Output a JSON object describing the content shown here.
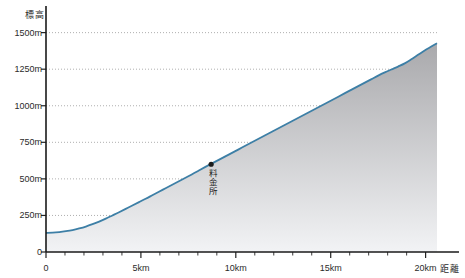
{
  "chart_data": {
    "type": "area",
    "title": "",
    "xlabel": "距離",
    "ylabel": "標高",
    "xlim": [
      0,
      20.6
    ],
    "ylim": [
      0,
      1600
    ],
    "grid": true,
    "legend": false,
    "x_unit": "km",
    "y_unit": "m",
    "x_ticks": [
      0,
      5,
      10,
      15,
      20
    ],
    "x_tick_labels": [
      "0",
      "5km",
      "10km",
      "15km",
      "20km"
    ],
    "x_minor_tick_step": 1,
    "y_ticks": [
      0,
      250,
      500,
      750,
      1000,
      1250,
      1500
    ],
    "y_tick_labels": [
      "0",
      "250m",
      "500m",
      "750m",
      "1000m",
      "1250m",
      "1500m"
    ],
    "series": [
      {
        "name": "標高",
        "line_color": "#3d7fa6",
        "fill_top_color": "#a9a9ac",
        "fill_bottom_color": "#f2f3f5",
        "x": [
          0.0,
          0.35,
          0.7,
          1.05,
          1.4,
          1.75,
          2.1,
          2.45,
          2.8,
          3.15,
          3.5,
          3.85,
          4.2,
          4.55,
          4.9,
          5.25,
          5.6,
          5.95,
          6.3,
          6.65,
          7.0,
          7.35,
          7.7,
          8.05,
          8.4,
          8.75,
          9.1,
          9.45,
          9.8,
          10.15,
          10.5,
          10.85,
          11.2,
          11.55,
          11.9,
          12.25,
          12.6,
          12.95,
          13.3,
          13.65,
          14.0,
          14.35,
          14.7,
          15.05,
          15.4,
          15.75,
          16.1,
          16.45,
          16.8,
          17.15,
          17.5,
          17.85,
          18.2,
          18.55,
          18.9,
          19.25,
          19.6,
          19.95,
          20.3,
          20.6
        ],
        "y": [
          130,
          132,
          136,
          142,
          150,
          161,
          174,
          190,
          208,
          228,
          250,
          272,
          295,
          318,
          341,
          364,
          388,
          412,
          436,
          460,
          484,
          508,
          532,
          557,
          582,
          606,
          630,
          654,
          678,
          702,
          726,
          750,
          774,
          798,
          822,
          846,
          870,
          894,
          918,
          942,
          966,
          990,
          1014,
          1038,
          1062,
          1086,
          1110,
          1134,
          1158,
          1182,
          1206,
          1228,
          1248,
          1268,
          1290,
          1318,
          1348,
          1378,
          1405,
          1428
        ]
      }
    ],
    "annotations": [
      {
        "name": "toll-gate",
        "label": "●料金所",
        "text_vertical": "料金所",
        "marker": "●",
        "x": 8.7,
        "y": 600
      }
    ],
    "start_elevation": 130,
    "end_elevation": 1428
  }
}
